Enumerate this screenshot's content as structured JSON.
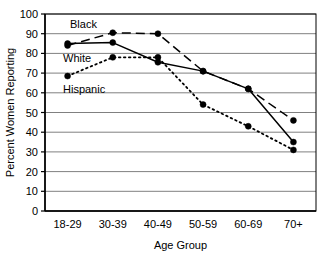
{
  "chart_data": {
    "type": "line",
    "title": "",
    "xlabel": "Age Group",
    "ylabel": "Percent Women Reporting",
    "categories": [
      "18-29",
      "30-39",
      "40-49",
      "50-59",
      "60-69",
      "70+"
    ],
    "ylim": [
      0,
      100
    ],
    "yticks": [
      0,
      10,
      20,
      30,
      40,
      50,
      60,
      70,
      80,
      90,
      100
    ],
    "grid": true,
    "legend_position": "inline-annotations",
    "series": [
      {
        "name": "Black",
        "line_style": "dashed",
        "marker": "circle",
        "color": "#000000",
        "values": [
          84,
          90.5,
          90,
          71,
          62,
          46
        ]
      },
      {
        "name": "White",
        "line_style": "solid",
        "marker": "circle",
        "color": "#000000",
        "values": [
          85,
          85.5,
          75.5,
          71,
          62,
          35
        ]
      },
      {
        "name": "Hispanic",
        "line_style": "dotted",
        "marker": "circle",
        "color": "#000000",
        "values": [
          68.5,
          78,
          78,
          54,
          43,
          31
        ]
      }
    ],
    "annotations": [
      {
        "text": "Black",
        "series": "Black"
      },
      {
        "text": "White",
        "series": "White"
      },
      {
        "text": "Hispanic",
        "series": "Hispanic"
      }
    ]
  }
}
